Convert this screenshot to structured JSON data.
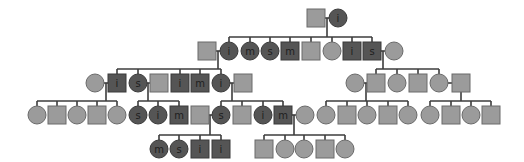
{
  "diagram": {
    "type": "pedigree",
    "colors": {
      "line": "#3c3c3c",
      "unaffected_fill": "#9b9b9b",
      "affected_fill": "#555555"
    },
    "size": 18,
    "individuals": [
      {
        "id": "g1a",
        "sex": "M",
        "x": 316,
        "y": 18,
        "affected": false,
        "label": ""
      },
      {
        "id": "g1b",
        "sex": "F",
        "x": 338,
        "y": 18,
        "affected": true,
        "label": "i"
      },
      {
        "id": "g2a",
        "sex": "M",
        "x": 207,
        "y": 51,
        "affected": false,
        "label": ""
      },
      {
        "id": "g2b",
        "sex": "F",
        "x": 229,
        "y": 51,
        "affected": true,
        "label": "i"
      },
      {
        "id": "g2c",
        "sex": "F",
        "x": 250,
        "y": 51,
        "affected": true,
        "label": "m"
      },
      {
        "id": "g2d",
        "sex": "F",
        "x": 270,
        "y": 51,
        "affected": true,
        "label": "s"
      },
      {
        "id": "g2e",
        "sex": "M",
        "x": 290,
        "y": 51,
        "affected": true,
        "label": "m"
      },
      {
        "id": "g2f",
        "sex": "M",
        "x": 311,
        "y": 51,
        "affected": false,
        "label": ""
      },
      {
        "id": "g2g",
        "sex": "F",
        "x": 332,
        "y": 51,
        "affected": false,
        "label": ""
      },
      {
        "id": "g2h",
        "sex": "M",
        "x": 352,
        "y": 51,
        "affected": true,
        "label": "i"
      },
      {
        "id": "g2i",
        "sex": "M",
        "x": 372,
        "y": 51,
        "affected": true,
        "label": "s"
      },
      {
        "id": "g2j",
        "sex": "F",
        "x": 394,
        "y": 51,
        "affected": false,
        "label": ""
      },
      {
        "id": "g3a",
        "sex": "F",
        "x": 95,
        "y": 83,
        "affected": false,
        "label": ""
      },
      {
        "id": "g3b",
        "sex": "M",
        "x": 117,
        "y": 83,
        "affected": true,
        "label": "i"
      },
      {
        "id": "g3c",
        "sex": "F",
        "x": 138,
        "y": 83,
        "affected": true,
        "label": "s"
      },
      {
        "id": "g3d",
        "sex": "M",
        "x": 159,
        "y": 83,
        "affected": false,
        "label": ""
      },
      {
        "id": "g3e",
        "sex": "M",
        "x": 180,
        "y": 83,
        "affected": true,
        "label": "i"
      },
      {
        "id": "g3f",
        "sex": "M",
        "x": 200,
        "y": 83,
        "affected": true,
        "label": "m"
      },
      {
        "id": "g3g",
        "sex": "F",
        "x": 221,
        "y": 83,
        "affected": true,
        "label": "i"
      },
      {
        "id": "g3h",
        "sex": "M",
        "x": 243,
        "y": 83,
        "affected": false,
        "label": ""
      },
      {
        "id": "g3i",
        "sex": "F",
        "x": 355,
        "y": 83,
        "affected": false,
        "label": ""
      },
      {
        "id": "g3j",
        "sex": "M",
        "x": 376,
        "y": 83,
        "affected": false,
        "label": ""
      },
      {
        "id": "g3k",
        "sex": "F",
        "x": 397,
        "y": 83,
        "affected": false,
        "label": ""
      },
      {
        "id": "g3l",
        "sex": "M",
        "x": 418,
        "y": 83,
        "affected": false,
        "label": ""
      },
      {
        "id": "g3m",
        "sex": "F",
        "x": 439,
        "y": 83,
        "affected": false,
        "label": ""
      },
      {
        "id": "g3n",
        "sex": "M",
        "x": 461,
        "y": 83,
        "affected": false,
        "label": ""
      },
      {
        "id": "g4a",
        "sex": "F",
        "x": 37,
        "y": 115,
        "affected": false,
        "label": ""
      },
      {
        "id": "g4b",
        "sex": "M",
        "x": 57,
        "y": 115,
        "affected": false,
        "label": ""
      },
      {
        "id": "g4c",
        "sex": "F",
        "x": 77,
        "y": 115,
        "affected": false,
        "label": ""
      },
      {
        "id": "g4d",
        "sex": "M",
        "x": 97,
        "y": 115,
        "affected": false,
        "label": ""
      },
      {
        "id": "g4e",
        "sex": "F",
        "x": 117,
        "y": 115,
        "affected": false,
        "label": ""
      },
      {
        "id": "g4f",
        "sex": "F",
        "x": 138,
        "y": 115,
        "affected": true,
        "label": "s"
      },
      {
        "id": "g4g",
        "sex": "F",
        "x": 158,
        "y": 115,
        "affected": true,
        "label": "i"
      },
      {
        "id": "g4h",
        "sex": "M",
        "x": 179,
        "y": 115,
        "affected": true,
        "label": "m"
      },
      {
        "id": "g4i",
        "sex": "M",
        "x": 200,
        "y": 115,
        "affected": false,
        "label": ""
      },
      {
        "id": "g4j",
        "sex": "F",
        "x": 221,
        "y": 115,
        "affected": true,
        "label": "s"
      },
      {
        "id": "g4k",
        "sex": "M",
        "x": 242,
        "y": 115,
        "affected": false,
        "label": ""
      },
      {
        "id": "g4l",
        "sex": "F",
        "x": 263,
        "y": 115,
        "affected": true,
        "label": "i"
      },
      {
        "id": "g4m",
        "sex": "M",
        "x": 283,
        "y": 115,
        "affected": true,
        "label": "m"
      },
      {
        "id": "g4n",
        "sex": "F",
        "x": 305,
        "y": 115,
        "affected": false,
        "label": ""
      },
      {
        "id": "g4o",
        "sex": "F",
        "x": 326,
        "y": 115,
        "affected": false,
        "label": ""
      },
      {
        "id": "g4p",
        "sex": "M",
        "x": 347,
        "y": 115,
        "affected": false,
        "label": ""
      },
      {
        "id": "g4q",
        "sex": "F",
        "x": 367,
        "y": 115,
        "affected": false,
        "label": ""
      },
      {
        "id": "g4r",
        "sex": "M",
        "x": 388,
        "y": 115,
        "affected": false,
        "label": ""
      },
      {
        "id": "g4s",
        "sex": "F",
        "x": 408,
        "y": 115,
        "affected": false,
        "label": ""
      },
      {
        "id": "g4t",
        "sex": "F",
        "x": 430,
        "y": 115,
        "affected": false,
        "label": ""
      },
      {
        "id": "g4u",
        "sex": "M",
        "x": 451,
        "y": 115,
        "affected": false,
        "label": ""
      },
      {
        "id": "g4v",
        "sex": "F",
        "x": 471,
        "y": 115,
        "affected": false,
        "label": ""
      },
      {
        "id": "g4w",
        "sex": "M",
        "x": 491,
        "y": 115,
        "affected": false,
        "label": ""
      },
      {
        "id": "g5a",
        "sex": "F",
        "x": 159,
        "y": 149,
        "affected": true,
        "label": "m"
      },
      {
        "id": "g5b",
        "sex": "F",
        "x": 179,
        "y": 149,
        "affected": true,
        "label": "s"
      },
      {
        "id": "g5c",
        "sex": "M",
        "x": 200,
        "y": 149,
        "affected": true,
        "label": "i"
      },
      {
        "id": "g5d",
        "sex": "M",
        "x": 221,
        "y": 149,
        "affected": true,
        "label": "i"
      },
      {
        "id": "g5e",
        "sex": "M",
        "x": 264,
        "y": 149,
        "affected": false,
        "label": ""
      },
      {
        "id": "g5f",
        "sex": "F",
        "x": 285,
        "y": 149,
        "affected": false,
        "label": ""
      },
      {
        "id": "g5g",
        "sex": "F",
        "x": 304,
        "y": 149,
        "affected": false,
        "label": ""
      },
      {
        "id": "g5h",
        "sex": "M",
        "x": 325,
        "y": 149,
        "affected": false,
        "label": ""
      },
      {
        "id": "g5i",
        "sex": "F",
        "x": 345,
        "y": 149,
        "affected": false,
        "label": ""
      }
    ],
    "families": [
      {
        "p1": "g1a",
        "p2": "g1b",
        "drop_x": 327,
        "y": 18,
        "sib_y": 37,
        "children": [
          "g2b",
          "g2c",
          "g2d",
          "g2e",
          "g2f",
          "g2g",
          "g2h",
          "g2i"
        ]
      },
      {
        "p1": "g2a",
        "p2": "g2b",
        "drop_x": 218,
        "y": 51,
        "sib_y": 69,
        "children": [
          "g3b",
          "g3c",
          "g3e",
          "g3f",
          "g3g"
        ]
      },
      {
        "p1": "g2i",
        "p2": "g2j",
        "drop_x": 383,
        "y": 51,
        "sib_y": 69,
        "children": [
          "g3j",
          "g3k",
          "g3l",
          "g3m"
        ]
      },
      {
        "p1": "g3a",
        "p2": "g3b",
        "drop_x": 106,
        "y": 83,
        "sib_y": 101,
        "children": [
          "g4a",
          "g4b",
          "g4c",
          "g4d",
          "g4e"
        ]
      },
      {
        "p1": "g3c",
        "p2": "g3d",
        "drop_x": 148,
        "y": 83,
        "sib_y": 101,
        "children": [
          "g4f",
          "g4g",
          "g4h"
        ]
      },
      {
        "p1": "g3g",
        "p2": "g3h",
        "drop_x": 232,
        "y": 83,
        "sib_y": 101,
        "children": [
          "g4j",
          "g4k",
          "g4l",
          "g4m"
        ]
      },
      {
        "p1": "g3i",
        "p2": "g3j",
        "drop_x": 366,
        "y": 83,
        "sib_y": 101,
        "children": [
          "g4o",
          "g4p",
          "g4q",
          "g4r",
          "g4s"
        ]
      },
      {
        "p1": "g3m",
        "p2": "g3n",
        "drop_x": 461,
        "y": 83,
        "sib_y": 101,
        "children": [
          "g4t",
          "g4u",
          "g4v",
          "g4w"
        ]
      },
      {
        "p1": "g4i",
        "p2": "g4j",
        "drop_x": 210,
        "y": 115,
        "sib_y": 135,
        "children": [
          "g5a",
          "g5b",
          "g5c",
          "g5d"
        ]
      },
      {
        "p1": "g4m",
        "p2": "g4n",
        "drop_x": 294,
        "y": 115,
        "sib_y": 135,
        "children": [
          "g5e",
          "g5f",
          "g5g",
          "g5h",
          "g5i"
        ]
      }
    ]
  }
}
